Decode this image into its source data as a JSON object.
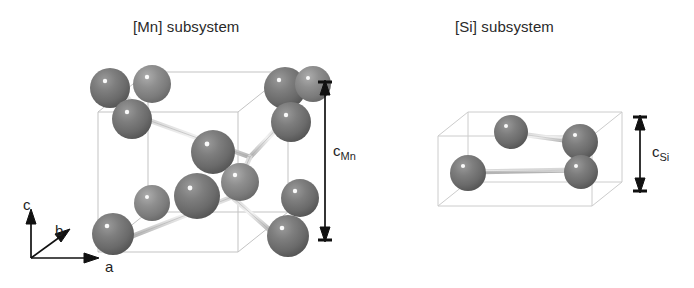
{
  "figure": {
    "domain": "diagram",
    "background_color": "#ffffff",
    "atom_color": "#6f6f6f",
    "atom_highlight_color": "#ffffff",
    "cell_edge_color": "#b9b9b9",
    "bond_color": "#c9c9c9",
    "annotation_color": "#1a1a1a"
  },
  "panels": [
    {
      "id": "mn",
      "title": "[Mn] subsystem",
      "element": "Mn",
      "atom_count": 14,
      "chain_type": "helical chain",
      "dimension": {
        "label_base": "c",
        "label_sub": "Mn",
        "relative_height": "tall"
      }
    },
    {
      "id": "si",
      "title": "[Si] subsystem",
      "element": "Si",
      "atom_count": 4,
      "chain_type": "zigzag chain",
      "dimension": {
        "label_base": "c",
        "label_sub": "Si",
        "relative_height": "short"
      }
    }
  ],
  "axes": {
    "name": "crystallographic-axis-triad",
    "a": "a",
    "b": "b",
    "c": "c"
  }
}
